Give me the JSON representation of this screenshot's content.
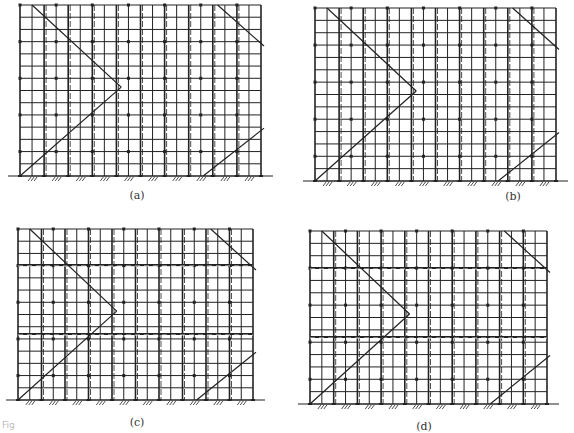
{
  "figure": {
    "line_color": "#222222",
    "background": "#ffffff",
    "caption_fragment": "Fig"
  },
  "panels": [
    {
      "id": "a",
      "label": "(a)",
      "frame": {
        "x0": 20,
        "x1": 261,
        "y0": 5,
        "y1": 176
      },
      "columns": 20,
      "rows": 14,
      "dashed_horizontals": [],
      "label_pos": {
        "x": 137,
        "y": 189
      }
    },
    {
      "id": "b",
      "label": "(b)",
      "frame": {
        "x0": 315,
        "x1": 556,
        "y0": 8,
        "y1": 181
      },
      "columns": 20,
      "rows": 14,
      "dashed_horizontals": [],
      "label_pos": {
        "x": 513,
        "y": 190
      }
    },
    {
      "id": "c",
      "label": "(c)",
      "frame": {
        "x0": 18,
        "x1": 253,
        "y0": 229,
        "y1": 400
      },
      "columns": 20,
      "rows": 14,
      "dashed_horizontals": [
        265,
        334
      ],
      "label_pos": {
        "x": 137,
        "y": 416
      }
    },
    {
      "id": "d",
      "label": "(d)",
      "frame": {
        "x0": 310,
        "x1": 547,
        "y0": 231,
        "y1": 404
      },
      "columns": 20,
      "rows": 14,
      "dashed_horizontals": [
        268,
        337
      ],
      "label_pos": {
        "x": 424,
        "y": 420
      }
    }
  ]
}
